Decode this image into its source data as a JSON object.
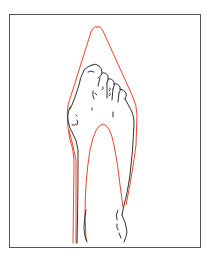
{
  "figure": {
    "colors": {
      "frame": "#555555",
      "shoe_outline": "#e8472b",
      "foot_outline": "#1a1a1a",
      "background": "#ffffff"
    },
    "elements": [
      {
        "name": "shoe-outline",
        "color": "red"
      },
      {
        "name": "foot-outline",
        "color": "black"
      }
    ]
  }
}
